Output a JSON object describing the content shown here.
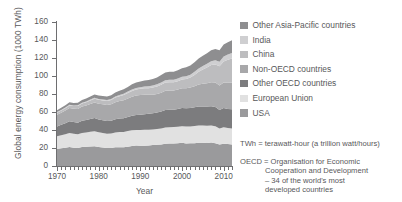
{
  "chart_data": {
    "type": "area",
    "stacked": true,
    "title": "",
    "xlabel": "Year",
    "ylabel": "Global energy consumption (1000 TWh)",
    "xlim": [
      1970,
      2012
    ],
    "ylim": [
      0,
      160
    ],
    "ytick_step": 20,
    "xtick_step": 10,
    "grid": false,
    "legend_position": "right",
    "yticks": [
      "0",
      "20",
      "40",
      "60",
      "80",
      "100",
      "120",
      "140",
      "160"
    ],
    "xticks": [
      "1970",
      "1980",
      "1990",
      "2000",
      "2010"
    ],
    "x": [
      1970,
      1971,
      1972,
      1973,
      1974,
      1975,
      1976,
      1977,
      1978,
      1979,
      1980,
      1981,
      1982,
      1983,
      1984,
      1985,
      1986,
      1987,
      1988,
      1989,
      1990,
      1991,
      1992,
      1993,
      1994,
      1995,
      1996,
      1997,
      1998,
      1999,
      2000,
      2001,
      2002,
      2003,
      2004,
      2005,
      2006,
      2007,
      2008,
      2009,
      2010,
      2011,
      2012
    ],
    "series": [
      {
        "name": "USA",
        "color": "#9a9a9c",
        "values": [
          19.0,
          19.6,
          20.4,
          21.0,
          20.4,
          20.0,
          21.0,
          21.4,
          21.8,
          21.9,
          21.0,
          20.6,
          19.9,
          20.0,
          20.9,
          20.9,
          20.9,
          21.5,
          22.3,
          22.7,
          22.6,
          22.5,
          22.9,
          23.3,
          23.7,
          24.0,
          24.7,
          24.9,
          24.9,
          25.2,
          25.7,
          25.1,
          25.3,
          25.4,
          25.8,
          25.8,
          25.6,
          26.0,
          25.3,
          23.9,
          24.6,
          24.4,
          24.0
        ]
      },
      {
        "name": "European Union",
        "color": "#e1e1e1",
        "values": [
          14.0,
          14.5,
          15.0,
          15.8,
          15.5,
          15.2,
          15.8,
          15.9,
          16.3,
          16.8,
          16.5,
          16.1,
          16.0,
          16.1,
          16.3,
          16.8,
          17.0,
          17.3,
          17.3,
          17.2,
          17.3,
          17.7,
          17.5,
          17.3,
          17.3,
          17.7,
          18.2,
          18.1,
          18.3,
          18.3,
          18.5,
          18.8,
          18.7,
          19.1,
          19.2,
          19.2,
          19.2,
          18.9,
          18.9,
          17.8,
          18.5,
          17.9,
          17.8
        ]
      },
      {
        "name": "Other OECD countries",
        "color": "#7c7c7e",
        "values": [
          11.0,
          11.6,
          12.2,
          13.0,
          12.9,
          12.9,
          13.4,
          13.7,
          14.0,
          14.5,
          14.3,
          14.2,
          14.1,
          14.2,
          14.8,
          15.0,
          15.2,
          15.6,
          16.2,
          16.7,
          17.1,
          17.4,
          17.7,
          17.9,
          18.4,
          18.9,
          19.4,
          19.6,
          19.4,
          19.8,
          20.3,
          20.3,
          20.5,
          20.7,
          21.0,
          21.2,
          21.3,
          21.6,
          21.4,
          20.6,
          21.3,
          21.1,
          21.2
        ]
      },
      {
        "name": "Non-OECD countries",
        "color": "#a8a8aa",
        "values": [
          13.0,
          13.5,
          14.0,
          14.6,
          14.8,
          15.2,
          15.8,
          16.2,
          16.8,
          17.3,
          17.5,
          17.6,
          17.8,
          18.2,
          18.9,
          19.5,
          20.0,
          20.6,
          21.2,
          21.6,
          21.9,
          21.6,
          21.0,
          20.8,
          20.7,
          20.9,
          21.3,
          21.3,
          21.3,
          21.6,
          22.0,
          22.3,
          22.8,
          23.5,
          24.5,
          25.2,
          25.9,
          26.6,
          27.2,
          27.2,
          28.4,
          29.2,
          29.8
        ]
      },
      {
        "name": "China",
        "color": "#bdbdbf",
        "values": [
          2.3,
          2.5,
          2.7,
          2.9,
          3.0,
          3.3,
          3.4,
          3.7,
          4.0,
          4.2,
          4.2,
          4.2,
          4.4,
          4.7,
          5.1,
          5.4,
          5.7,
          6.1,
          6.4,
          6.7,
          6.8,
          7.1,
          7.4,
          7.9,
          8.3,
          8.9,
          9.2,
          9.1,
          9.1,
          9.2,
          9.6,
          10.1,
          10.9,
          12.5,
          14.3,
          15.9,
          17.4,
          19.0,
          20.0,
          21.3,
          23.4,
          25.5,
          26.6
        ]
      },
      {
        "name": "India",
        "color": "#cfcfd1",
        "values": [
          0.6,
          0.6,
          0.7,
          0.7,
          0.7,
          0.8,
          0.8,
          0.9,
          0.9,
          1.0,
          1.0,
          1.1,
          1.1,
          1.2,
          1.3,
          1.4,
          1.5,
          1.6,
          1.7,
          1.8,
          1.9,
          2.0,
          2.1,
          2.2,
          2.3,
          2.5,
          2.6,
          2.7,
          2.8,
          3.0,
          3.1,
          3.2,
          3.3,
          3.4,
          3.6,
          3.8,
          4.1,
          4.4,
          4.7,
          5.1,
          5.4,
          5.7,
          6.1
        ]
      },
      {
        "name": "Other Asia-Pacific countries",
        "color": "#8e8e90",
        "values": [
          2.1,
          2.3,
          2.5,
          2.7,
          2.8,
          2.9,
          3.1,
          3.3,
          3.5,
          3.7,
          3.8,
          3.9,
          4.0,
          4.2,
          4.5,
          4.7,
          4.9,
          5.2,
          5.6,
          6.0,
          6.3,
          6.6,
          7.0,
          7.3,
          7.7,
          8.2,
          8.6,
          8.9,
          8.8,
          9.2,
          9.5,
          9.8,
          10.2,
          10.6,
          11.1,
          11.4,
          11.8,
          12.2,
          12.4,
          12.6,
          13.3,
          13.7,
          14.1
        ]
      }
    ]
  },
  "legend": {
    "items": [
      {
        "label": "Other Asia-Pacific countries",
        "color": "#8e8e90"
      },
      {
        "label": "India",
        "color": "#cfcfd1"
      },
      {
        "label": "China",
        "color": "#bdbdbf"
      },
      {
        "label": "Non-OECD countries",
        "color": "#a8a8aa"
      },
      {
        "label": "Other OECD countries",
        "color": "#7c7c7e"
      },
      {
        "label": "European Union",
        "color": "#e1e1e1"
      },
      {
        "label": "USA",
        "color": "#9a9a9c"
      }
    ]
  },
  "notes": {
    "twh": "TWh = terawatt-hour (a trillion watt/hours)",
    "oecd_head": "OECD = Organisation for Economic",
    "oecd_line2": "Cooperation and Development",
    "oecd_line3": "– 34 of the world's most",
    "oecd_line4": "developed countries"
  }
}
